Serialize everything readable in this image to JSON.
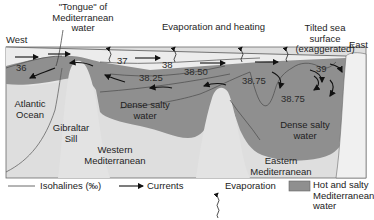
{
  "diagram": {
    "title_labels": {
      "west": "West",
      "east": "East",
      "tongue": [
        "\"Tongue\" of",
        "Mediterranean",
        "water"
      ],
      "evaporation_heating": "Evaporation and heating",
      "tilted_surface": [
        "Tilted sea",
        "surface",
        "(exaggerated)"
      ]
    },
    "regions": {
      "atlantic": [
        "Atlantic",
        "Ocean"
      ],
      "gibraltar": [
        "Gibraltar",
        "Sill"
      ],
      "western_med": [
        "Western",
        "Mediterranean"
      ],
      "eastern_med": [
        "Eastern",
        "Mediterranean"
      ],
      "dense_west": [
        "Dense salty",
        "water"
      ],
      "dense_east": [
        "Dense salty",
        "water"
      ]
    },
    "isohalines": {
      "v36": "36",
      "v37": "37",
      "v38": "38",
      "v38_25": "38.25",
      "v38_50": "38.50",
      "v38_75_a": "38.75",
      "v38_75_b": "38.75",
      "v39": "39"
    },
    "colors": {
      "salty_water": "#8f8f8f",
      "light_water": "#e4e4e4",
      "seafloor": "#dcdcdc",
      "land": "#eeeeee",
      "line": "#3a3a3a"
    }
  },
  "legend": {
    "isohalines": "Isohalines (‰)",
    "currents": "Currents",
    "evaporation": "Evaporation",
    "hot_salty": [
      "Hot and salty",
      "Mediterranean",
      "water"
    ]
  }
}
